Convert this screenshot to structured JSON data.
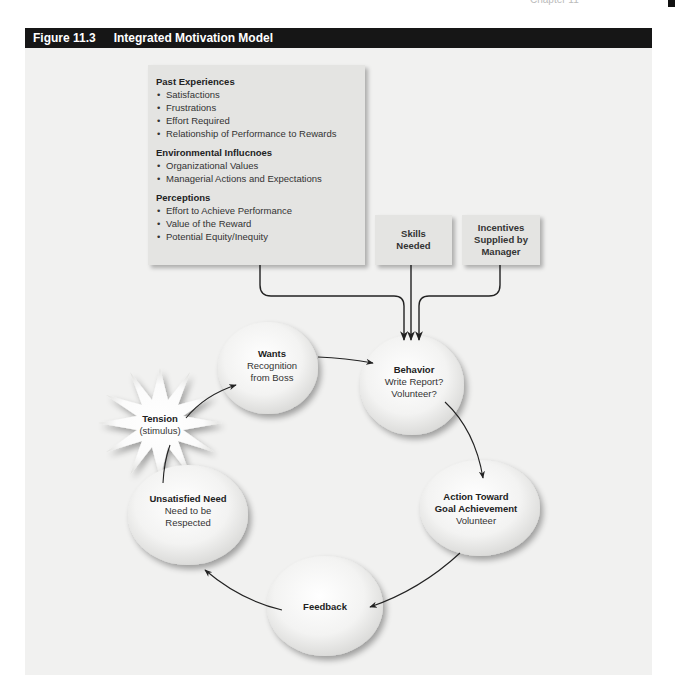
{
  "page": {
    "chapter_header_fragment": "Chapter 11"
  },
  "figure": {
    "number": "Figure 11.3",
    "title": "Integrated Motivation Model"
  },
  "influences_box": {
    "sections": [
      {
        "title": "Past Experiences",
        "items": [
          "Satisfactions",
          "Frustrations",
          "Effort Required",
          "Relationship of Performance to Rewards"
        ]
      },
      {
        "title": "Environmental Influcnoes",
        "items": [
          "Organizational Values",
          "Managerial Actions and Expectations"
        ]
      },
      {
        "title": "Perceptions",
        "items": [
          "Effort to Achieve Performance",
          "Value of the Reward",
          "Potential Equity/Inequity"
        ]
      }
    ]
  },
  "skills_box": {
    "line1": "Skills",
    "line2": "Needed"
  },
  "incentives_box": {
    "line1": "Incentives",
    "line2": "Supplied by",
    "line3": "Manager"
  },
  "nodes": {
    "wants": {
      "title": "Wants",
      "line1": "Recognition",
      "line2": "from Boss"
    },
    "behavior": {
      "title": "Behavior",
      "line1": "Write Report?",
      "line2": "Volunteer?"
    },
    "action": {
      "title1": "Action Toward",
      "title2": "Goal Achievement",
      "line1": "Volunteer"
    },
    "feedback": {
      "title": "Feedback"
    },
    "unsatisfied": {
      "title": "Unsatisfied Need",
      "line1": "Need to be",
      "line2": "Respected"
    },
    "tension": {
      "title": "Tension",
      "line1": "(stimulus)"
    }
  },
  "colors": {
    "header_bg": "#161616",
    "panel_bg": "#f1f1f0",
    "box_bg": "#e4e4e2",
    "arrow": "#222222"
  }
}
